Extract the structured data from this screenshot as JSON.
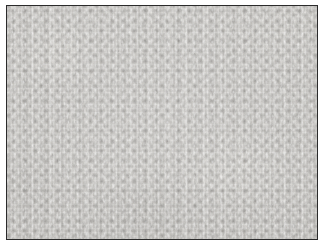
{
  "page": {
    "background_color": "#ffffff",
    "width_px": 328,
    "height_px": 248
  },
  "photo": {
    "name": "fabric-texture-photo",
    "subject": "close-up macro photograph of light gray non-woven knit fabric",
    "alt_text": "Light gray textile surface with vertical wale streaks and a regular grid of darker gray pores",
    "frame": {
      "border_color": "#2b2b2b",
      "border_width_px": 1,
      "offset_left_px": 6,
      "offset_top_px": 5,
      "content_width_px": 310,
      "content_height_px": 233
    },
    "texture": {
      "pattern": "knit-wale-and-pore-grid",
      "orientation": "vertical-wales",
      "blob_pitch_x_px": 11,
      "blob_pitch_y_px": 10,
      "base_color": "#d6d4d0",
      "highlight_color": "#e2e0dc",
      "midtone_color": "#c8c6c2",
      "pore_color": "#a09e9b",
      "shadow_color": "#8e8c88"
    }
  }
}
